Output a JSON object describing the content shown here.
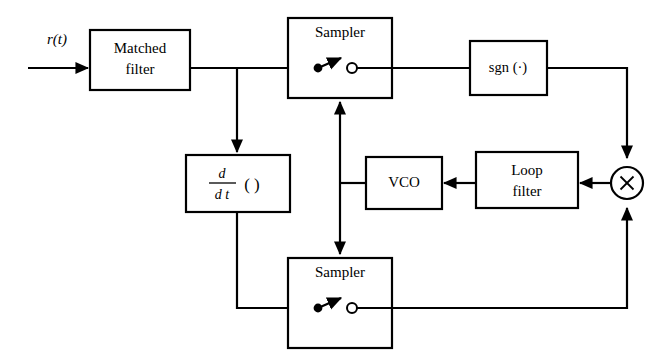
{
  "figure": {
    "type": "block-diagram",
    "background_color": "#ffffff",
    "line_color": "#000000",
    "width": 664,
    "height": 360
  },
  "input": {
    "label": "r(t)",
    "name": "received-signal"
  },
  "blocks": [
    {
      "id": "matched-filter",
      "label_line1": "Matched",
      "label_line2": "filter"
    },
    {
      "id": "sampler-top",
      "label": "Sampler"
    },
    {
      "id": "sgn",
      "label": "sgn (·)"
    },
    {
      "id": "derivative",
      "numerator": "d",
      "denominator": "d t",
      "argument": "( )"
    },
    {
      "id": "vco",
      "label": "VCO"
    },
    {
      "id": "loop-filter",
      "label_line1": "Loop",
      "label_line2": "filter"
    },
    {
      "id": "sampler-bottom",
      "label": "Sampler"
    },
    {
      "id": "multiplier",
      "label": "×"
    }
  ],
  "connections": [
    {
      "from": "input",
      "to": "matched-filter"
    },
    {
      "from": "matched-filter",
      "to": "sampler-top"
    },
    {
      "from": "matched-filter",
      "to": "derivative"
    },
    {
      "from": "sampler-top",
      "to": "sgn"
    },
    {
      "from": "sgn",
      "to": "multiplier"
    },
    {
      "from": "derivative",
      "to": "sampler-bottom"
    },
    {
      "from": "sampler-bottom",
      "to": "multiplier"
    },
    {
      "from": "multiplier",
      "to": "loop-filter"
    },
    {
      "from": "loop-filter",
      "to": "vco"
    },
    {
      "from": "vco",
      "to": "sampler-top"
    },
    {
      "from": "vco",
      "to": "sampler-bottom"
    }
  ]
}
